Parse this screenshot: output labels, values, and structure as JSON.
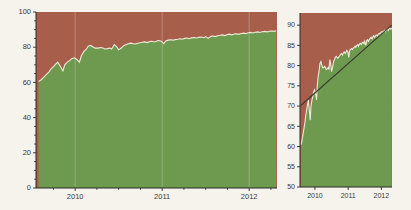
{
  "figure": {
    "background_color": "#f6f3ed",
    "panel_count": 2
  },
  "colors": {
    "upper_area": "#a75f4c",
    "lower_area": "#6d9a4f",
    "boundary_line": "#efe9d8",
    "trend_line": "#3a3a30",
    "axis": "#2b2b28",
    "gridline": "#cfcfc6",
    "tick_label": "#3a3a38"
  },
  "chart_data": [
    {
      "type": "area",
      "id": "left-panel",
      "title": "",
      "subtitle": "",
      "xlabel": "",
      "ylabel": "",
      "stacked": true,
      "grid": true,
      "legend": "none",
      "xlim": [
        2009.55,
        2012.32
      ],
      "ylim": [
        0,
        100
      ],
      "xticks": [
        2010,
        2011,
        2012
      ],
      "xticklabels": [
        "2010",
        "2011",
        "2012"
      ],
      "yticks": [
        0,
        20,
        40,
        60,
        80,
        100
      ],
      "yticklabels": [
        "0",
        "20",
        "40",
        "60",
        "80",
        "100"
      ],
      "yminorticks": [
        5,
        10,
        15,
        25,
        30,
        35,
        45,
        50,
        55,
        65,
        70,
        75,
        85,
        90,
        95
      ],
      "xminorticks": [
        2009.75,
        2010.25,
        2010.5,
        2010.75,
        2011.25,
        2011.5,
        2011.75,
        2012.25
      ],
      "series": [
        {
          "name": "lower-green-area",
          "color": "#6d9a4f",
          "fill_from": 0,
          "x": [
            2009.58,
            2009.61,
            2009.64,
            2009.67,
            2009.7,
            2009.72,
            2009.75,
            2009.78,
            2009.8,
            2009.83,
            2009.86,
            2009.88,
            2009.91,
            2009.94,
            2009.96,
            2009.99,
            2010.02,
            2010.05,
            2010.07,
            2010.1,
            2010.13,
            2010.15,
            2010.18,
            2010.21,
            2010.23,
            2010.26,
            2010.29,
            2010.32,
            2010.34,
            2010.37,
            2010.4,
            2010.42,
            2010.45,
            2010.48,
            2010.5,
            2010.53,
            2010.56,
            2010.59,
            2010.61,
            2010.64,
            2010.67,
            2010.69,
            2010.72,
            2010.75,
            2010.77,
            2010.8,
            2010.83,
            2010.86,
            2010.88,
            2010.91,
            2010.94,
            2010.96,
            2010.99,
            2011.02,
            2011.04,
            2011.07,
            2011.1,
            2011.13,
            2011.15,
            2011.18,
            2011.21,
            2011.23,
            2011.26,
            2011.29,
            2011.31,
            2011.34,
            2011.37,
            2011.4,
            2011.42,
            2011.45,
            2011.48,
            2011.5,
            2011.53,
            2011.56,
            2011.58,
            2011.61,
            2011.64,
            2011.67,
            2011.69,
            2011.72,
            2011.75,
            2011.77,
            2011.8,
            2011.83,
            2011.85,
            2011.88,
            2011.91,
            2011.94,
            2011.96,
            2011.99,
            2012.02,
            2012.04,
            2012.07,
            2012.1,
            2012.12,
            2012.15,
            2012.18,
            2012.21,
            2012.23,
            2012.26,
            2012.29,
            2012.31
          ],
          "values": [
            60.5,
            61.5,
            63.0,
            64.5,
            66.0,
            67.5,
            69.0,
            70.5,
            71.5,
            69.0,
            66.5,
            70.0,
            71.5,
            72.5,
            73.5,
            74.0,
            73.0,
            71.5,
            75.0,
            77.5,
            79.0,
            80.5,
            81.0,
            80.0,
            79.5,
            79.5,
            79.8,
            79.5,
            79.0,
            79.2,
            79.5,
            79.0,
            81.5,
            80.0,
            78.5,
            79.5,
            81.0,
            81.5,
            82.0,
            82.3,
            82.0,
            81.8,
            82.2,
            82.5,
            82.8,
            83.0,
            82.6,
            83.2,
            83.4,
            83.0,
            83.5,
            83.8,
            83.4,
            82.0,
            83.5,
            84.0,
            84.2,
            84.0,
            84.3,
            84.5,
            84.8,
            84.5,
            85.0,
            85.2,
            84.8,
            85.3,
            85.5,
            85.2,
            85.6,
            85.8,
            85.4,
            86.0,
            85.0,
            86.2,
            86.4,
            86.0,
            86.5,
            86.8,
            87.0,
            86.6,
            87.2,
            87.4,
            87.0,
            87.5,
            87.6,
            87.3,
            87.8,
            88.0,
            87.7,
            88.2,
            88.4,
            88.1,
            88.5,
            88.7,
            88.4,
            88.8,
            89.0,
            88.7,
            89.1,
            89.2,
            89.0,
            89.3
          ]
        },
        {
          "name": "upper-red-area",
          "color": "#a75f4c",
          "fill_to": 100,
          "description": "complement of lower area up to 100"
        }
      ]
    },
    {
      "type": "area",
      "id": "right-panel",
      "title": "",
      "subtitle": "",
      "xlabel": "",
      "ylabel": "",
      "stacked": true,
      "grid": false,
      "legend": "none",
      "xlim": [
        2009.55,
        2012.32
      ],
      "ylim": [
        50,
        93
      ],
      "xticks": [
        2010,
        2011,
        2012
      ],
      "xticklabels": [
        "2010",
        "2011",
        "2012"
      ],
      "yticks": [
        50,
        55,
        60,
        65,
        70,
        75,
        80,
        85,
        90
      ],
      "yticklabels": [
        "50",
        "55",
        "60",
        "65",
        "70",
        "75",
        "80",
        "85",
        "90"
      ],
      "series": [
        {
          "name": "lower-green-area",
          "color": "#6d9a4f",
          "fill_from": 50,
          "note": "same data as left panel, vertically magnified",
          "x": [
            2009.58,
            2009.61,
            2009.64,
            2009.67,
            2009.7,
            2009.72,
            2009.75,
            2009.78,
            2009.8,
            2009.83,
            2009.86,
            2009.88,
            2009.91,
            2009.94,
            2009.96,
            2009.99,
            2010.02,
            2010.05,
            2010.07,
            2010.1,
            2010.13,
            2010.15,
            2010.18,
            2010.21,
            2010.23,
            2010.26,
            2010.29,
            2010.32,
            2010.34,
            2010.37,
            2010.4,
            2010.42,
            2010.45,
            2010.48,
            2010.5,
            2010.53,
            2010.56,
            2010.59,
            2010.61,
            2010.64,
            2010.67,
            2010.69,
            2010.72,
            2010.75,
            2010.77,
            2010.8,
            2010.83,
            2010.86,
            2010.88,
            2010.91,
            2010.94,
            2010.96,
            2010.99,
            2011.02,
            2011.04,
            2011.07,
            2011.1,
            2011.13,
            2011.15,
            2011.18,
            2011.21,
            2011.23,
            2011.26,
            2011.29,
            2011.31,
            2011.34,
            2011.37,
            2011.4,
            2011.42,
            2011.45,
            2011.48,
            2011.5,
            2011.53,
            2011.56,
            2011.58,
            2011.61,
            2011.64,
            2011.67,
            2011.69,
            2011.72,
            2011.75,
            2011.77,
            2011.8,
            2011.83,
            2011.85,
            2011.88,
            2011.91,
            2011.94,
            2011.96,
            2011.99,
            2012.02,
            2012.04,
            2012.07,
            2012.1,
            2012.12,
            2012.15,
            2012.18,
            2012.21,
            2012.23,
            2012.26,
            2012.29,
            2012.31
          ],
          "values": [
            60.5,
            61.5,
            63.0,
            64.5,
            66.0,
            67.5,
            69.0,
            70.5,
            71.5,
            69.0,
            66.5,
            70.0,
            71.5,
            72.5,
            73.5,
            74.0,
            73.0,
            71.5,
            75.0,
            77.5,
            79.0,
            80.5,
            81.0,
            80.0,
            79.5,
            79.5,
            79.8,
            79.5,
            79.0,
            79.2,
            79.5,
            79.0,
            81.5,
            80.0,
            78.5,
            79.5,
            81.0,
            81.5,
            82.0,
            82.3,
            82.0,
            81.8,
            82.2,
            82.5,
            82.8,
            83.0,
            82.6,
            83.2,
            83.4,
            83.0,
            83.5,
            83.8,
            83.4,
            82.0,
            83.5,
            84.0,
            84.2,
            84.0,
            84.3,
            84.5,
            84.8,
            84.5,
            85.0,
            85.2,
            84.8,
            85.3,
            85.5,
            85.2,
            85.6,
            85.8,
            85.4,
            86.0,
            85.0,
            86.2,
            86.4,
            86.0,
            86.5,
            86.8,
            87.0,
            86.6,
            87.2,
            87.4,
            87.0,
            87.5,
            87.6,
            87.3,
            87.8,
            88.0,
            87.7,
            88.2,
            88.4,
            88.1,
            88.5,
            88.7,
            88.4,
            88.8,
            89.0,
            88.7,
            89.1,
            89.2,
            89.0,
            89.3
          ]
        },
        {
          "name": "upper-red-area",
          "color": "#a75f4c",
          "fill_to": 93
        },
        {
          "name": "trend-line",
          "color": "#3a3a30",
          "type": "line",
          "x": [
            2009.58,
            2012.31
          ],
          "values": [
            70.2,
            90.0
          ]
        }
      ]
    }
  ]
}
